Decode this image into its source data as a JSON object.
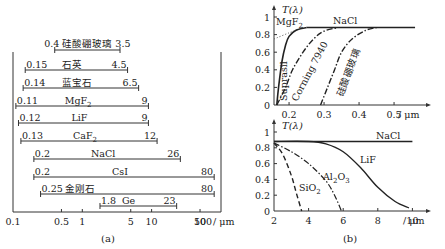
{
  "chart_data": [
    {
      "type": "bar",
      "subtype": "range-bars",
      "title": "",
      "caption": "(a)",
      "xlabel": "/ μm",
      "xscale": "log",
      "xlim": [
        0.1,
        100
      ],
      "xticks": [
        "0.1",
        "0.5",
        "1",
        "5",
        "10",
        "50",
        "100"
      ],
      "xtick_values": [
        0.1,
        0.5,
        1,
        5,
        10,
        50,
        100
      ],
      "x_unit": "/ μm",
      "bars": [
        {
          "name": "硅酸硼玻璃",
          "min": 0.4,
          "max": 3.5,
          "min_label": "0.4",
          "max_label": "3.5"
        },
        {
          "name": "石英",
          "min": 0.15,
          "max": 4.5,
          "min_label": "0.15",
          "max_label": "4.5"
        },
        {
          "name": "蓝宝石",
          "min": 0.14,
          "max": 6.5,
          "min_label": "0.14",
          "max_label": "6.5"
        },
        {
          "name": "MgF",
          "sub": "2",
          "min": 0.11,
          "max": 9,
          "min_label": "0.11",
          "max_label": "9"
        },
        {
          "name": "LiF",
          "min": 0.12,
          "max": 9,
          "min_label": "0.12",
          "max_label": "9"
        },
        {
          "name": "CaF",
          "sub": "2",
          "min": 0.13,
          "max": 12,
          "min_label": "0.13",
          "max_label": "12"
        },
        {
          "name": "NaCl",
          "min": 0.2,
          "max": 26,
          "min_label": "0.2",
          "max_label": "26"
        },
        {
          "name": "CsI",
          "min": 0.2,
          "max": 80,
          "min_label": "0.2",
          "max_label": "80"
        },
        {
          "name": "金刚石",
          "min": 0.25,
          "max": 80,
          "min_label": "0.25",
          "max_label": "80"
        },
        {
          "name": "Ge",
          "min": 1.8,
          "max": 23,
          "min_label": "1.8",
          "max_label": "23"
        }
      ]
    },
    {
      "type": "line",
      "caption": "(b)",
      "panel": "top",
      "ylabel": "T(λ)",
      "xlabel": "/ μm",
      "xlim": [
        0.157,
        0.58
      ],
      "ylim": [
        0,
        1
      ],
      "xticks": [
        "0.2",
        "0.3",
        "0.4",
        "0.5"
      ],
      "yticks": [
        "0",
        "0.2",
        "0.4",
        "0.6",
        "0.8",
        "1"
      ],
      "series": [
        {
          "name": "NaCl",
          "style": "solid",
          "x": [
            0.25,
            0.3,
            0.4,
            0.5,
            0.56
          ],
          "y": [
            0.88,
            0.88,
            0.88,
            0.88,
            0.88
          ]
        },
        {
          "name": "MgF2",
          "label": "MgF",
          "sub": "2",
          "style": "dotted",
          "x": [
            0.157,
            0.2,
            0.24
          ],
          "y": [
            0.75,
            0.82,
            0.88
          ]
        },
        {
          "name": "Suprasil",
          "style": "solid",
          "x": [
            0.165,
            0.17,
            0.18,
            0.19,
            0.2,
            0.22,
            0.25
          ],
          "y": [
            0.0,
            0.2,
            0.5,
            0.68,
            0.78,
            0.85,
            0.88
          ]
        },
        {
          "name": "Corning 7940",
          "style": "dashdot",
          "x": [
            0.165,
            0.19,
            0.21,
            0.24,
            0.27,
            0.3,
            0.34
          ],
          "y": [
            0.0,
            0.2,
            0.4,
            0.6,
            0.75,
            0.84,
            0.88
          ]
        },
        {
          "name": "硅酸硼玻璃",
          "style": "dashdot",
          "x": [
            0.29,
            0.31,
            0.33,
            0.35,
            0.38,
            0.42,
            0.45
          ],
          "y": [
            0.0,
            0.2,
            0.4,
            0.6,
            0.75,
            0.85,
            0.88
          ]
        }
      ]
    },
    {
      "type": "line",
      "caption": "(b)",
      "panel": "bottom",
      "ylabel": "T(λ)",
      "xlabel": "/ μm",
      "xlim": [
        2,
        10.7
      ],
      "ylim": [
        0,
        1
      ],
      "xticks": [
        "2",
        "4",
        "6",
        "8",
        "10"
      ],
      "yticks": [
        "0",
        "0.2",
        "0.4",
        "0.6",
        "0.8",
        "1"
      ],
      "series": [
        {
          "name": "NaCl",
          "style": "solid",
          "x": [
            2,
            4,
            6,
            8,
            10
          ],
          "y": [
            0.88,
            0.88,
            0.88,
            0.88,
            0.88
          ]
        },
        {
          "name": "LiF",
          "style": "solid",
          "x": [
            2,
            4,
            5,
            6,
            7,
            8,
            9,
            9.8
          ],
          "y": [
            0.88,
            0.88,
            0.85,
            0.75,
            0.55,
            0.3,
            0.12,
            0.04
          ]
        },
        {
          "name": "Al2O3",
          "label": "Al",
          "sub": "2",
          "label2": "O",
          "sub2": "3",
          "style": "dashdot",
          "x": [
            2,
            3,
            4,
            5,
            5.5,
            5.9
          ],
          "y": [
            0.86,
            0.75,
            0.6,
            0.38,
            0.2,
            0.0
          ]
        },
        {
          "name": "SiO2",
          "label": "SiO",
          "sub": "2",
          "style": "dashed",
          "x": [
            2,
            2.5,
            3,
            3.3,
            3.6
          ],
          "y": [
            0.86,
            0.72,
            0.45,
            0.22,
            0.0
          ]
        }
      ]
    }
  ],
  "labels": {
    "caption_a": "(a)",
    "caption_b": "(b)",
    "unit": "/ μm",
    "t_axis": "T(λ)",
    "nacl": "NaCl",
    "mgf": "MgF",
    "suprasil": "Suprasil",
    "corning": "Corning 7940",
    "borosilicate": "硅酸硼玻璃",
    "lif": "LiF",
    "al": "Al",
    "o": "O",
    "sio": "SiO",
    "sub2": "2",
    "sub3": "3"
  }
}
